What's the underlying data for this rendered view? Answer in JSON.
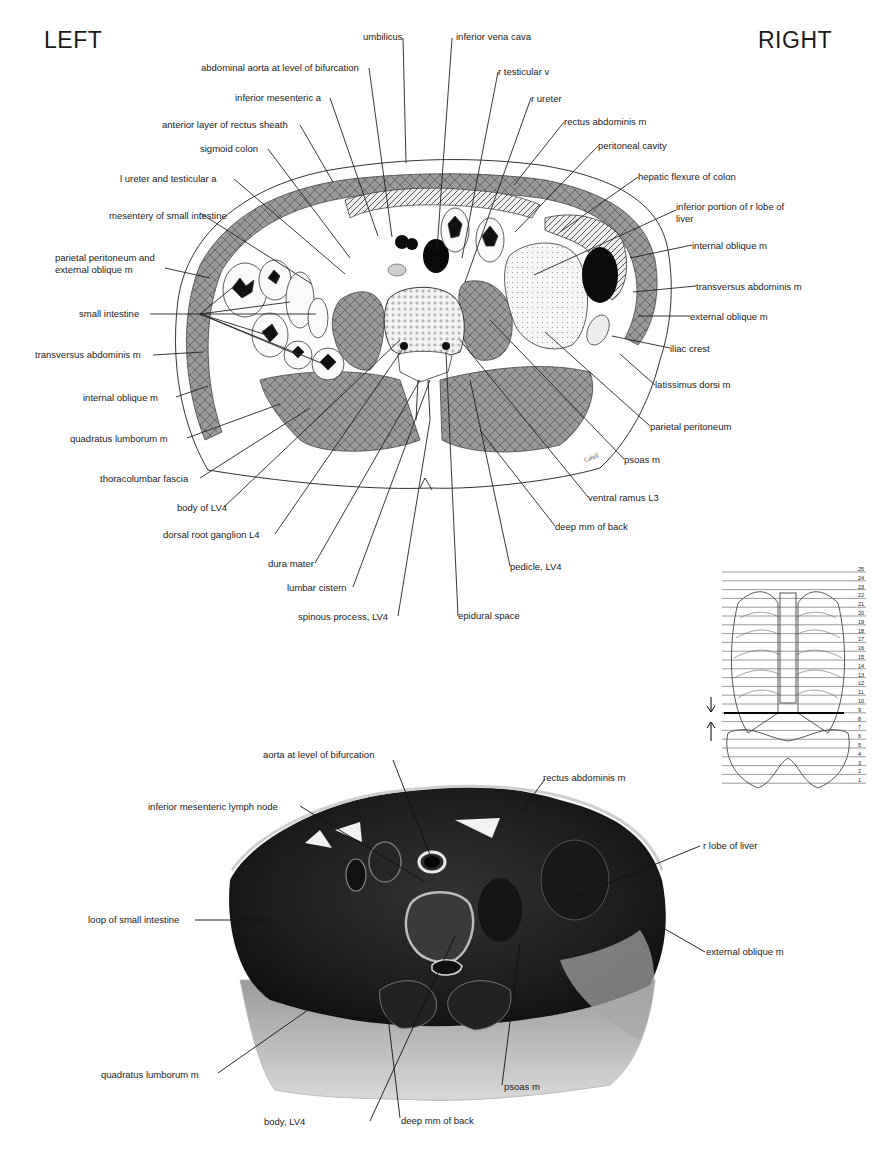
{
  "orientation": {
    "left": "LEFT",
    "right": "RIGHT"
  },
  "drawing": {
    "labels": [
      {
        "id": "umbilicus",
        "text": "umbilicus",
        "x": 363,
        "y": 31
      },
      {
        "id": "ivc",
        "text": "inferior vena cava",
        "x": 456,
        "y": 31
      },
      {
        "id": "aorta",
        "text": "abdominal aorta at level of bifurcation",
        "x": 201,
        "y": 62
      },
      {
        "id": "r_testicular_v",
        "text": "r testicular v",
        "x": 498,
        "y": 66
      },
      {
        "id": "inf_mes_a",
        "text": "inferior mesenteric a",
        "x": 235,
        "y": 92
      },
      {
        "id": "r_ureter",
        "text": "r ureter",
        "x": 531,
        "y": 93
      },
      {
        "id": "ant_rectus",
        "text": "anterior layer of rectus sheath",
        "x": 162,
        "y": 119
      },
      {
        "id": "rectus_abd",
        "text": "rectus abdominis m",
        "x": 564,
        "y": 116
      },
      {
        "id": "sigmoid",
        "text": "sigmoid colon",
        "x": 200,
        "y": 143
      },
      {
        "id": "peritoneal_cavity",
        "text": "peritoneal cavity",
        "x": 598,
        "y": 140
      },
      {
        "id": "hepatic_flexure",
        "text": "hepatic flexure of colon",
        "x": 638,
        "y": 171
      },
      {
        "id": "l_ureter",
        "text": "l ureter and testicular a",
        "x": 120,
        "y": 173
      },
      {
        "id": "inf_liver",
        "text": "inferior portion of r lobe of liver",
        "x": 676,
        "y": 201,
        "wrap": true
      },
      {
        "id": "mesentery",
        "text": "mesentery of small intestine",
        "x": 109,
        "y": 210,
        "wrap": true
      },
      {
        "id": "int_oblique_r",
        "text": "internal oblique m",
        "x": 692,
        "y": 240
      },
      {
        "id": "parietal_ext",
        "text": "parietal peritoneum and external oblique m",
        "x": 55,
        "y": 252,
        "wrap": true
      },
      {
        "id": "transversus_r",
        "text": "transversus abdominis m",
        "x": 696,
        "y": 281
      },
      {
        "id": "small_int",
        "text": "small intestine",
        "x": 79,
        "y": 308
      },
      {
        "id": "ext_oblique_r",
        "text": "external oblique m",
        "x": 690,
        "y": 311
      },
      {
        "id": "transversus_l",
        "text": "transversus abdominis m",
        "x": 35,
        "y": 349
      },
      {
        "id": "iliac_crest",
        "text": "iliac crest",
        "x": 670,
        "y": 343
      },
      {
        "id": "int_oblique_l",
        "text": "internal oblique m",
        "x": 83,
        "y": 392
      },
      {
        "id": "latissimus",
        "text": "latissimus dorsi m",
        "x": 655,
        "y": 379
      },
      {
        "id": "quadratus",
        "text": "quadratus lumborum m",
        "x": 70,
        "y": 433
      },
      {
        "id": "parietal_r",
        "text": "parietal peritoneum",
        "x": 650,
        "y": 421
      },
      {
        "id": "thoracolumbar",
        "text": "thoracolumbar fascia",
        "x": 100,
        "y": 473
      },
      {
        "id": "psoas",
        "text": "psoas m",
        "x": 624,
        "y": 454
      },
      {
        "id": "body_lv4",
        "text": "body of LV4",
        "x": 177,
        "y": 502
      },
      {
        "id": "ventral_ramus",
        "text": "ventral ramus  L3",
        "x": 588,
        "y": 492
      },
      {
        "id": "drg",
        "text": "dorsal root ganglion L4",
        "x": 163,
        "y": 529
      },
      {
        "id": "deep_mm",
        "text": "deep mm of back",
        "x": 555,
        "y": 521
      },
      {
        "id": "dura",
        "text": "dura mater",
        "x": 268,
        "y": 558
      },
      {
        "id": "pedicle",
        "text": "pedicle, LV4",
        "x": 510,
        "y": 561
      },
      {
        "id": "lumbar_cistern",
        "text": "lumbar cistern",
        "x": 287,
        "y": 582
      },
      {
        "id": "spinous",
        "text": "spinous process, LV4",
        "x": 298,
        "y": 611
      },
      {
        "id": "epidural",
        "text": "epidural space",
        "x": 458,
        "y": 610
      }
    ],
    "signature": "Cahill"
  },
  "inset": {
    "levels": [
      "25",
      "24",
      "23",
      "22",
      "21",
      "20",
      "19",
      "18",
      "17",
      "16",
      "15",
      "14",
      "13",
      "12",
      "11",
      "10",
      "9",
      "8",
      "7",
      "6",
      "5",
      "4",
      "3",
      "2",
      "1"
    ],
    "marked_level": "10"
  },
  "photo": {
    "labels": [
      {
        "id": "aorta_bif",
        "text": "aorta at level of bifurcation",
        "x": 263,
        "y": 749
      },
      {
        "id": "rectus_photo",
        "text": "rectus abdominis m",
        "x": 543,
        "y": 772
      },
      {
        "id": "imln",
        "text": "inferior mesenteric lymph node",
        "x": 148,
        "y": 801
      },
      {
        "id": "r_lobe_liver",
        "text": "r lobe of liver",
        "x": 703,
        "y": 840
      },
      {
        "id": "loop_small_int",
        "text": "loop of small intestine",
        "x": 88,
        "y": 914
      },
      {
        "id": "ext_oblique_photo",
        "text": "external oblique m",
        "x": 706,
        "y": 946
      },
      {
        "id": "quadratus_photo",
        "text": "quadratus lumborum m",
        "x": 101,
        "y": 1069
      },
      {
        "id": "psoas_photo",
        "text": "psoas m",
        "x": 504,
        "y": 1081
      },
      {
        "id": "body_lv4_photo",
        "text": "body, LV4",
        "x": 264,
        "y": 1116
      },
      {
        "id": "deep_mm_photo",
        "text": "deep mm of back",
        "x": 401,
        "y": 1115
      }
    ]
  }
}
